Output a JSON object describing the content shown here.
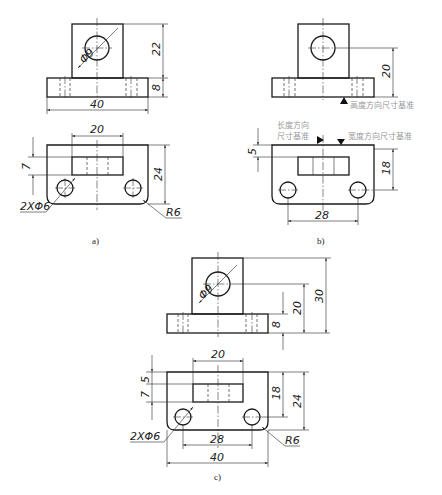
{
  "figure": {
    "captions": {
      "a": "a)",
      "b": "b)",
      "c": "c)"
    }
  },
  "view_a": {
    "front": {
      "hole_dia": "Φ9",
      "height_upright": "22",
      "height_base": "8",
      "width_base": "40"
    },
    "top": {
      "slot_width": "20",
      "slot_offset": "7",
      "depth": "24",
      "hole_spec": "2XΦ6",
      "corner_radius": "R6"
    }
  },
  "view_b": {
    "front": {
      "hole_center_height": "20",
      "datum_height_label": "高度方向尺寸基准"
    },
    "top": {
      "slot_offset": "5",
      "hole_spacing_depth": "18",
      "hole_spacing": "28",
      "datum_length_label_line1": "长度方向",
      "datum_length_label_line2": "尺寸基准",
      "datum_width_label": "宽度方向尺寸基准"
    }
  },
  "view_c": {
    "front": {
      "hole_dia": "Φ9",
      "height_base": "8",
      "hole_center_height": "20",
      "total_height": "30"
    },
    "top": {
      "slot_width": "20",
      "slot_offset_5": "5",
      "slot_offset_7": "7",
      "hole_spacing_depth": "18",
      "depth": "24",
      "hole_spec": "2XΦ6",
      "hole_spacing": "28",
      "corner_radius": "R6",
      "width_base": "40"
    }
  },
  "colors": {
    "line": "#1a1a1a",
    "annotation_gray": "#999999",
    "background": "#ffffff"
  }
}
